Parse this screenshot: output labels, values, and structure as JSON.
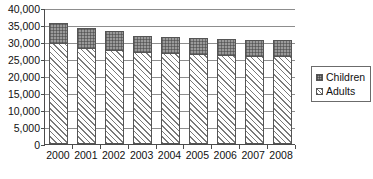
{
  "chart_data": {
    "type": "bar",
    "subtype": "stacked-column",
    "title": "",
    "xlabel": "",
    "ylabel": "",
    "categories": [
      "2000",
      "2001",
      "2002",
      "2003",
      "2004",
      "2005",
      "2006",
      "2007",
      "2008"
    ],
    "series": [
      {
        "name": "Adults",
        "values": [
          29700,
          28300,
          27700,
          27000,
          26700,
          26500,
          26100,
          26000,
          25800
        ]
      },
      {
        "name": "Children",
        "values": [
          6000,
          5900,
          5400,
          4900,
          4800,
          4700,
          4800,
          4700,
          4900
        ]
      }
    ],
    "totals": [
      35700,
      34200,
      33100,
      31900,
      31500,
      31200,
      30900,
      30700,
      30700
    ],
    "ylim": [
      0,
      40000
    ],
    "ytick_values": [
      0,
      5000,
      10000,
      15000,
      20000,
      25000,
      30000,
      35000,
      40000
    ],
    "ytick_labels": [
      "0",
      "5,000",
      "10,000",
      "15,000",
      "20,000",
      "25,000",
      "30,000",
      "35,000",
      "40,000"
    ],
    "grid": true,
    "grid_axis": "y",
    "legend_position": "right",
    "legend_entries": [
      "Children",
      "Adults"
    ],
    "colors": {
      "children": "#9a9a9a",
      "adults": "#ffffff",
      "axis": "#4c4c4c",
      "grid": "#8d8d8d",
      "text": "#111111"
    }
  },
  "legend": {
    "children_label": "Children",
    "adults_label": "Adults"
  },
  "caption": {
    "text": ""
  }
}
